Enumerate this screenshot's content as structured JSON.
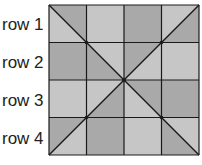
{
  "rows": [
    {
      "label": "row 1"
    },
    {
      "label": "row 2"
    },
    {
      "label": "row 3"
    },
    {
      "label": "row 4"
    }
  ],
  "colors": {
    "dark": "#a9a9a9",
    "light": "#c6c6c6",
    "line": "#1a1a1a"
  },
  "grid": {
    "size": 4,
    "cells": [
      [
        "split-ur-dark",
        "light",
        "dark",
        "split-lr-dark"
      ],
      [
        "dark",
        "split-ll-dark",
        "split-ul-dark",
        "light"
      ],
      [
        "light",
        "split-lr-dark",
        "split-ur-dark",
        "dark"
      ],
      [
        "split-ul-dark",
        "dark",
        "light",
        "split-ll-dark"
      ]
    ]
  }
}
